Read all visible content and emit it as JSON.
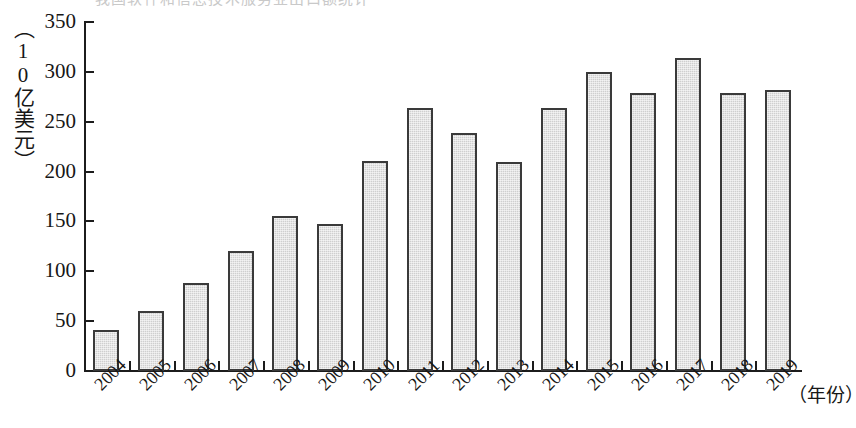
{
  "figure": {
    "cropped_header_text": "我国软件和信息技术服务业出口额统计",
    "y_axis_unit_label": "（10亿美元）",
    "x_axis_unit_label": "（年份）"
  },
  "chart_data": {
    "type": "bar",
    "title": "",
    "xlabel": "（年份）",
    "ylabel": "（10亿美元）",
    "ylim": [
      0,
      350
    ],
    "yticks": [
      0,
      50,
      100,
      150,
      200,
      250,
      300,
      350
    ],
    "ytick_labels": [
      "0",
      "50",
      "100",
      "150",
      "200",
      "250",
      "300",
      "350"
    ],
    "grid": false,
    "legend": null,
    "categories": [
      "2004",
      "2005",
      "2006",
      "2007",
      "2008",
      "2009",
      "2010",
      "2011",
      "2012",
      "2013",
      "2014",
      "2015",
      "2016",
      "2017",
      "2018",
      "2019"
    ],
    "values": [
      41,
      60,
      88,
      120,
      155,
      147,
      211,
      264,
      239,
      210,
      264,
      300,
      279,
      314,
      279,
      282
    ],
    "bar_style": {
      "fill": "#cfcfcf",
      "edge": "#3a3a3a",
      "pattern": "checkered-dither"
    }
  }
}
